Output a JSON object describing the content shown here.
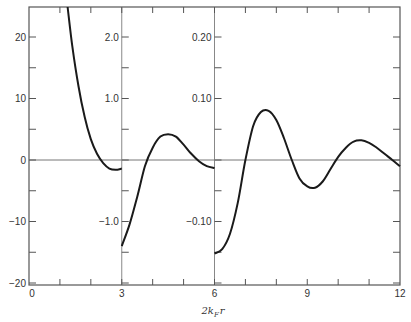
{
  "chart_data": {
    "type": "line",
    "title": "",
    "xlabel": "2k_F r",
    "xlabel_display": {
      "main": "2k",
      "sub": "F",
      "tail": "r"
    },
    "ylabel": "",
    "xlim": [
      0,
      12
    ],
    "x_ticks": [
      0,
      3,
      6,
      9,
      12
    ],
    "x_tick_labels": [
      "0",
      "3",
      "6",
      "9",
      "12"
    ],
    "grid": false,
    "legend": null,
    "panels": [
      {
        "name": "panel-0-3",
        "x_range": [
          0,
          3
        ],
        "ylim": [
          -20,
          25
        ],
        "y_ticks": [
          20,
          10,
          0,
          -10,
          -20
        ],
        "y_tick_labels": [
          "20",
          "10",
          "0",
          "−10",
          "−20"
        ],
        "series": {
          "x": [
            1.25,
            1.4,
            1.6,
            1.8,
            2.0,
            2.2,
            2.4,
            2.6,
            2.8,
            3.0
          ],
          "y": [
            25.0,
            18.5,
            12.0,
            7.0,
            3.4,
            1.0,
            -0.5,
            -1.4,
            -1.6,
            -1.4
          ]
        }
      },
      {
        "name": "panel-3-6",
        "x_range": [
          3,
          6
        ],
        "ylim": [
          -2.0,
          2.5
        ],
        "y_ticks": [
          2.0,
          1.0,
          -1.0
        ],
        "y_tick_labels": [
          "2.0",
          "1.0",
          "−1.0"
        ],
        "series": {
          "x": [
            3.0,
            3.25,
            3.5,
            3.75,
            4.0,
            4.25,
            4.5,
            4.75,
            5.0,
            5.25,
            5.5,
            5.75,
            6.0
          ],
          "y": [
            -1.4,
            -1.05,
            -0.6,
            -0.1,
            0.2,
            0.38,
            0.42,
            0.38,
            0.25,
            0.1,
            -0.02,
            -0.1,
            -0.13
          ]
        }
      },
      {
        "name": "panel-6-12",
        "x_range": [
          6,
          12
        ],
        "ylim": [
          -0.2,
          0.25
        ],
        "y_ticks": [
          0.2,
          0.1,
          -0.1
        ],
        "y_tick_labels": [
          "0.20",
          "0.10",
          "−0.10"
        ],
        "series": {
          "x": [
            6.0,
            6.25,
            6.5,
            6.75,
            7.0,
            7.25,
            7.5,
            7.75,
            8.0,
            8.25,
            8.5,
            8.75,
            9.0,
            9.25,
            9.5,
            9.75,
            10.0,
            10.25,
            10.5,
            10.75,
            11.0,
            11.25,
            11.5,
            11.75,
            12.0
          ],
          "y": [
            -0.152,
            -0.145,
            -0.12,
            -0.07,
            0.0,
            0.055,
            0.078,
            0.08,
            0.065,
            0.035,
            0.0,
            -0.03,
            -0.043,
            -0.045,
            -0.035,
            -0.015,
            0.005,
            0.02,
            0.03,
            0.032,
            0.028,
            0.02,
            0.01,
            0.0,
            -0.01
          ]
        }
      }
    ],
    "zero_line": true
  }
}
